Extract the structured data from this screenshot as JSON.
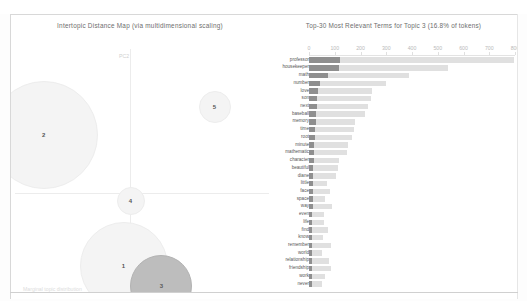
{
  "app": {
    "name": "pyLDAvis topic model visualization"
  },
  "left_panel": {
    "title": "Intertopic Distance Map (via multidimensional scaling)",
    "axis_x_label": "PC1",
    "axis_y_label": "PC2",
    "legend_note": "Marginal topic distribution"
  },
  "right_panel": {
    "title": "Top-30 Most Relevant Terms for Topic 3 (16.8% of tokens)",
    "ticks": [
      "0",
      "100",
      "200",
      "300",
      "400",
      "500",
      "600",
      "700",
      "800"
    ]
  },
  "chart_data": [
    {
      "type": "scatter",
      "title": "Intertopic Distance Map (via multidimensional scaling)",
      "xlabel": "PC1",
      "ylabel": "PC2",
      "grid": false,
      "selected_topic": 3,
      "note": "Bubble area is proportional to marginal topic distribution",
      "points": [
        {
          "label": "2",
          "x": -0.62,
          "y": 0.42,
          "size": 54,
          "selected": false
        },
        {
          "label": "5",
          "x": 0.6,
          "y": 0.62,
          "size": 16,
          "selected": false
        },
        {
          "label": "4",
          "x": 0.0,
          "y": -0.05,
          "size": 14,
          "selected": false
        },
        {
          "label": "1",
          "x": -0.05,
          "y": -0.52,
          "size": 44,
          "selected": false
        },
        {
          "label": "3",
          "x": 0.22,
          "y": -0.66,
          "size": 31,
          "selected": true
        }
      ]
    },
    {
      "type": "bar",
      "orientation": "horizontal",
      "title": "Top-30 Most Relevant Terms for Topic 3 (16.8% of tokens)",
      "xlabel": "",
      "ylabel": "",
      "xlim": [
        0,
        800
      ],
      "ticks": [
        0,
        100,
        200,
        300,
        400,
        500,
        600,
        700,
        800
      ],
      "grid": false,
      "legend": [
        "Overall term frequency",
        "Estimated term frequency within the selected topic"
      ],
      "categories": [
        "professor",
        "housekeeper",
        "math",
        "number",
        "love",
        "son",
        "next",
        "baseball",
        "memory",
        "time",
        "root",
        "minute",
        "mathematic",
        "character",
        "beautiful",
        "diane",
        "little",
        "face",
        "space",
        "way",
        "even",
        "life",
        "find",
        "know",
        "remember",
        "world",
        "relationship",
        "friendship",
        "work",
        "never"
      ],
      "series": [
        {
          "name": "Overall term frequency",
          "values": [
            795,
            540,
            390,
            300,
            245,
            240,
            228,
            218,
            180,
            175,
            168,
            150,
            148,
            118,
            112,
            106,
            70,
            80,
            64,
            90,
            60,
            58,
            72,
            55,
            86,
            50,
            78,
            86,
            62,
            50
          ]
        },
        {
          "name": "Estimated term frequency within the selected topic",
          "values": [
            122,
            116,
            74,
            42,
            34,
            30,
            30,
            28,
            26,
            24,
            22,
            21,
            20,
            18,
            17,
            16,
            15,
            15,
            14,
            14,
            13,
            13,
            12,
            12,
            12,
            11,
            11,
            11,
            10,
            10
          ]
        }
      ]
    }
  ],
  "colors": {
    "bar_overall": "#e0e0e0",
    "bar_topic": "#8f8f8f",
    "bubble_plain": "#f4f4f4",
    "bubble_selected": "#bdbdbd",
    "axis": "#ececec",
    "text": "#6d6d6d"
  }
}
